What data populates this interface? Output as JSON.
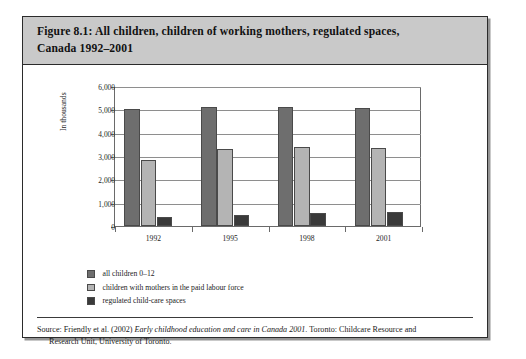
{
  "figure": {
    "title": "Figure 8.1: All children, children of working mothers, regulated spaces, Canada 1992–2001",
    "title_line1": "Figure 8.1: All children, children of working mothers, regulated spaces,",
    "title_line2": "Canada 1992–2001"
  },
  "source": {
    "prefix": "Source: Friendly et al. (2002) ",
    "italic_title": "Early childhood education and care in Canada 2001",
    "suffix": ". Toronto: Childcare Resource and",
    "line2": "Research Unit, University of Toronto."
  },
  "chart_data": {
    "type": "bar",
    "title": "Figure 8.1: All children, children of working mothers, regulated spaces, Canada 1992–2001",
    "xlabel": "",
    "ylabel": "In thousands",
    "ylim": [
      0,
      6000
    ],
    "ytick_labels": [
      "6,000",
      "5,000",
      "4,000",
      "3,000",
      "2,000",
      "1,000",
      "0"
    ],
    "ytick_values": [
      6000,
      5000,
      4000,
      3000,
      2000,
      1000,
      0
    ],
    "grid": true,
    "legend_position": "below-left",
    "categories": [
      "1992",
      "1995",
      "1998",
      "2001"
    ],
    "series": [
      {
        "name": "all children 0–12",
        "color": "#6e6e6e",
        "values": [
          5000,
          5120,
          5120,
          5050
        ]
      },
      {
        "name": "children with mothers in the paid labour force",
        "color": "#b4b4b4",
        "values": [
          2850,
          3300,
          3400,
          3350
        ]
      },
      {
        "name": "regulated child-care spaces",
        "color": "#3a3a3a",
        "values": [
          400,
          470,
          560,
          600
        ]
      }
    ]
  },
  "colors": {
    "series_all_children": "#6e6e6e",
    "series_working_mothers": "#b4b4b4",
    "series_regulated_spaces": "#3a3a3a",
    "title_band": "#c9c9c9",
    "frame": "#2b2b2b"
  }
}
